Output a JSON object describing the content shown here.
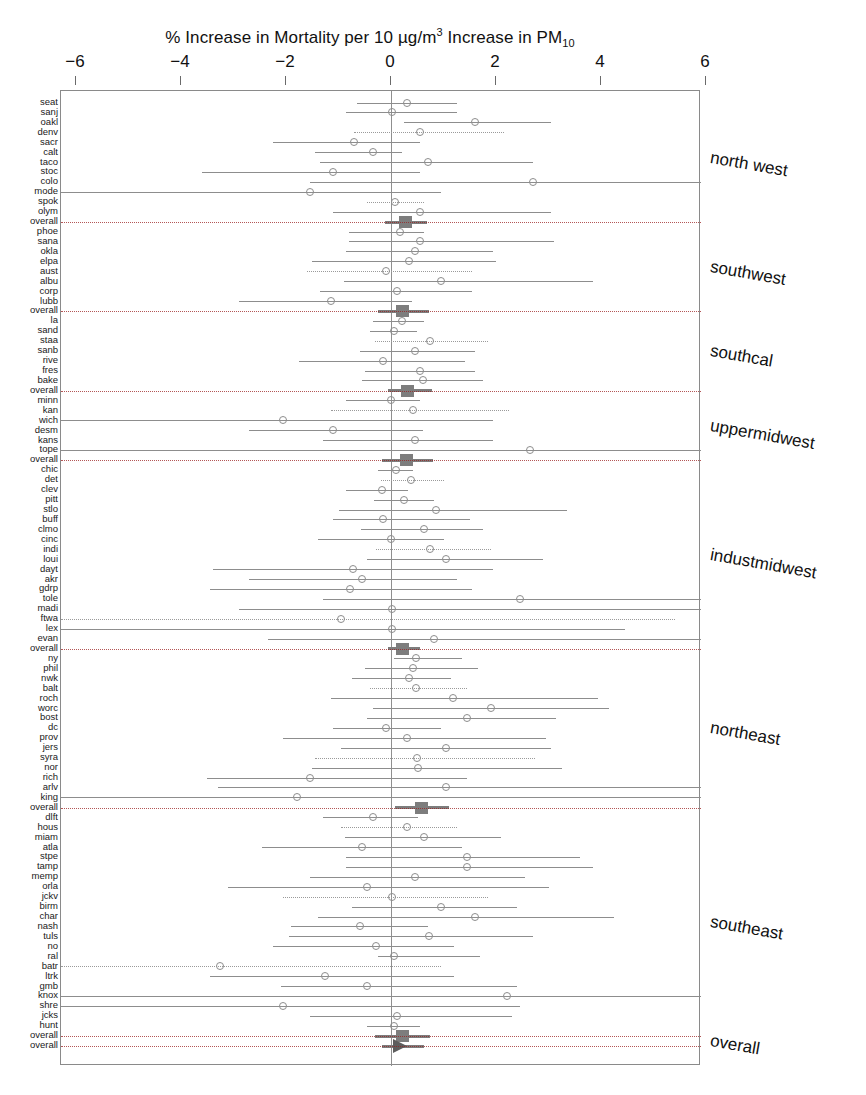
{
  "title": {
    "prefix": "% Increase in Mortality per 10 ",
    "unit": "µg/m",
    "unit_exp": "3",
    "middle": " Increase in PM",
    "sub": "10"
  },
  "axis": {
    "label": "% Increase in Mortality per 10 µg/m3 Increase in PM10",
    "ticks": [
      -6,
      -4,
      -2,
      0,
      2,
      4,
      6
    ],
    "tick_labels": [
      "−6",
      "−4",
      "−2",
      "0",
      "2",
      "4",
      "6"
    ],
    "xmin": -6.8,
    "xmax": 6.7
  },
  "regions": [
    {
      "name": "north west",
      "label": "north west"
    },
    {
      "name": "southwest",
      "label": "southwest"
    },
    {
      "name": "southcal",
      "label": "southcal"
    },
    {
      "name": "uppermidwest",
      "label": "uppermidwest"
    },
    {
      "name": "industmidwest",
      "label": "industmidwest"
    },
    {
      "name": "northeast",
      "label": "northeast"
    },
    {
      "name": "southeast",
      "label": "southeast"
    },
    {
      "name": "overall",
      "label": "overall"
    }
  ],
  "chart_data": {
    "type": "forest",
    "title": "% Increase in Mortality per 10 µg/m3 Increase in PM10",
    "xlabel": "% Increase in Mortality per 10 µg/m3 Increase in PM10",
    "ylabel": "",
    "xlim": [
      -6.8,
      6.7
    ],
    "grid": false,
    "legend": "none",
    "marker_open_circle": "city estimate",
    "marker_filled_square": "regional pooled estimate",
    "marker_triangle": "national pooled estimate",
    "rows": [
      {
        "label": "seat",
        "region": "north west",
        "est": 0.3,
        "lo": -0.65,
        "hi": 1.25,
        "type": "city"
      },
      {
        "label": "sanj",
        "region": "north west",
        "est": 0.02,
        "lo": -0.85,
        "hi": 1.25,
        "type": "city"
      },
      {
        "label": "oakl",
        "region": "north west",
        "est": 1.6,
        "lo": 0.25,
        "hi": 3.05,
        "type": "city"
      },
      {
        "label": "denv",
        "region": "north west",
        "est": 0.55,
        "lo": -0.7,
        "hi": 2.15,
        "type": "city"
      },
      {
        "label": "sacr",
        "region": "north west",
        "est": -0.7,
        "lo": -2.25,
        "hi": 0.55,
        "type": "city"
      },
      {
        "label": "calt",
        "region": "north west",
        "est": -0.35,
        "lo": -1.45,
        "hi": 0.2,
        "type": "city"
      },
      {
        "label": "taco",
        "region": "north west",
        "est": 0.7,
        "lo": -1.35,
        "hi": 2.7,
        "type": "city"
      },
      {
        "label": "stoc",
        "region": "north west",
        "est": -1.1,
        "lo": -3.6,
        "hi": 0.55,
        "type": "city"
      },
      {
        "label": "colo",
        "region": "north west",
        "est": 2.7,
        "lo": -1.55,
        "hi": 6.7,
        "type": "city"
      },
      {
        "label": "mode",
        "region": "north west",
        "est": -1.55,
        "lo": -6.8,
        "hi": 0.95,
        "type": "city"
      },
      {
        "label": "spok",
        "region": "north west",
        "est": 0.08,
        "lo": -0.45,
        "hi": 0.62,
        "type": "city"
      },
      {
        "label": "olym",
        "region": "north west",
        "est": 0.55,
        "lo": -1.1,
        "hi": 3.05,
        "type": "city"
      },
      {
        "label": "overall",
        "region": "north west",
        "est": 0.28,
        "lo": -0.12,
        "hi": 0.68,
        "type": "pooled"
      },
      {
        "label": "phoe",
        "region": "southwest",
        "est": 0.18,
        "lo": -0.8,
        "hi": 0.62,
        "type": "city"
      },
      {
        "label": "sana",
        "region": "southwest",
        "est": 0.55,
        "lo": -0.8,
        "hi": 3.1,
        "type": "city"
      },
      {
        "label": "okla",
        "region": "southwest",
        "est": 0.45,
        "lo": -0.85,
        "hi": 1.95,
        "type": "city"
      },
      {
        "label": "elpa",
        "region": "southwest",
        "est": 0.35,
        "lo": -1.5,
        "hi": 2.0,
        "type": "city"
      },
      {
        "label": "aust",
        "region": "southwest",
        "est": -0.1,
        "lo": -1.6,
        "hi": 1.55,
        "type": "city"
      },
      {
        "label": "albu",
        "region": "southwest",
        "est": 0.95,
        "lo": -0.9,
        "hi": 3.85,
        "type": "city"
      },
      {
        "label": "corp",
        "region": "southwest",
        "est": 0.12,
        "lo": -1.35,
        "hi": 1.55,
        "type": "city"
      },
      {
        "label": "lubb",
        "region": "southwest",
        "est": -1.15,
        "lo": -2.9,
        "hi": 0.4,
        "type": "city"
      },
      {
        "label": "overall",
        "region": "southwest",
        "est": 0.22,
        "lo": -0.25,
        "hi": 0.72,
        "type": "pooled"
      },
      {
        "label": "la",
        "region": "southcal",
        "est": 0.2,
        "lo": -0.35,
        "hi": 0.62,
        "type": "city"
      },
      {
        "label": "sand",
        "region": "southcal",
        "est": 0.05,
        "lo": -0.4,
        "hi": 0.5,
        "type": "city"
      },
      {
        "label": "staa",
        "region": "southcal",
        "est": 0.75,
        "lo": -0.3,
        "hi": 1.85,
        "type": "city"
      },
      {
        "label": "sanb",
        "region": "southcal",
        "est": 0.45,
        "lo": -0.6,
        "hi": 1.6,
        "type": "city"
      },
      {
        "label": "rive",
        "region": "southcal",
        "est": -0.15,
        "lo": -1.75,
        "hi": 1.4,
        "type": "city"
      },
      {
        "label": "fres",
        "region": "southcal",
        "est": 0.55,
        "lo": -0.5,
        "hi": 1.6,
        "type": "city"
      },
      {
        "label": "bake",
        "region": "southcal",
        "est": 0.6,
        "lo": -0.55,
        "hi": 1.75,
        "type": "city"
      },
      {
        "label": "overall",
        "region": "southcal",
        "est": 0.32,
        "lo": -0.05,
        "hi": 0.78,
        "type": "pooled"
      },
      {
        "label": "minn",
        "region": "uppermidwest",
        "est": 0.0,
        "lo": -0.85,
        "hi": 0.55,
        "type": "city"
      },
      {
        "label": "kan",
        "region": "uppermidwest",
        "est": 0.42,
        "lo": -1.15,
        "hi": 2.25,
        "type": "city"
      },
      {
        "label": "wich",
        "region": "uppermidwest",
        "est": -2.05,
        "lo": -6.8,
        "hi": 1.95,
        "type": "city"
      },
      {
        "label": "desm",
        "region": "uppermidwest",
        "est": -1.1,
        "lo": -2.7,
        "hi": 0.6,
        "type": "city"
      },
      {
        "label": "kans",
        "region": "uppermidwest",
        "est": 0.45,
        "lo": -1.3,
        "hi": 1.95,
        "type": "city"
      },
      {
        "label": "tope",
        "region": "uppermidwest",
        "est": 2.65,
        "lo": -6.8,
        "hi": 6.7,
        "type": "city"
      },
      {
        "label": "overall",
        "region": "uppermidwest",
        "est": 0.3,
        "lo": -0.18,
        "hi": 0.8,
        "type": "pooled"
      },
      {
        "label": "chic",
        "region": "industmidwest",
        "est": 0.1,
        "lo": -0.25,
        "hi": 0.42,
        "type": "city"
      },
      {
        "label": "det",
        "region": "industmidwest",
        "est": 0.38,
        "lo": -0.2,
        "hi": 1.0,
        "type": "city"
      },
      {
        "label": "clev",
        "region": "industmidwest",
        "est": -0.18,
        "lo": -0.85,
        "hi": 0.32,
        "type": "city"
      },
      {
        "label": "pitt",
        "region": "industmidwest",
        "est": 0.25,
        "lo": -0.32,
        "hi": 0.82,
        "type": "city"
      },
      {
        "label": "stlo",
        "region": "industmidwest",
        "est": 0.85,
        "lo": -1.0,
        "hi": 3.35,
        "type": "city"
      },
      {
        "label": "buff",
        "region": "industmidwest",
        "est": -0.15,
        "lo": -1.1,
        "hi": 1.5,
        "type": "city"
      },
      {
        "label": "clmo",
        "region": "industmidwest",
        "est": 0.62,
        "lo": -0.58,
        "hi": 1.75,
        "type": "city"
      },
      {
        "label": "cinc",
        "region": "industmidwest",
        "est": 0.0,
        "lo": -1.4,
        "hi": 1.0,
        "type": "city"
      },
      {
        "label": "indi",
        "region": "industmidwest",
        "est": 0.75,
        "lo": -0.28,
        "hi": 1.9,
        "type": "city"
      },
      {
        "label": "loui",
        "region": "industmidwest",
        "est": 1.05,
        "lo": -0.45,
        "hi": 2.9,
        "type": "city"
      },
      {
        "label": "dayt",
        "region": "industmidwest",
        "est": -0.72,
        "lo": -3.4,
        "hi": 1.95,
        "type": "city"
      },
      {
        "label": "akr",
        "region": "industmidwest",
        "est": -0.55,
        "lo": -2.7,
        "hi": 1.25,
        "type": "city"
      },
      {
        "label": "gdrp",
        "region": "industmidwest",
        "est": -0.78,
        "lo": -3.45,
        "hi": 1.55,
        "type": "city"
      },
      {
        "label": "tole",
        "region": "industmidwest",
        "est": 2.45,
        "lo": -1.3,
        "hi": 6.7,
        "type": "city"
      },
      {
        "label": "madi",
        "region": "industmidwest",
        "est": 0.02,
        "lo": -2.9,
        "hi": 6.7,
        "type": "city"
      },
      {
        "label": "ftwa",
        "region": "industmidwest",
        "est": -0.95,
        "lo": -6.8,
        "hi": 5.4,
        "type": "city"
      },
      {
        "label": "lex",
        "region": "industmidwest",
        "est": 0.02,
        "lo": -6.8,
        "hi": 4.45,
        "type": "city"
      },
      {
        "label": "evan",
        "region": "industmidwest",
        "est": 0.82,
        "lo": -2.35,
        "hi": 6.7,
        "type": "city"
      },
      {
        "label": "overall",
        "region": "industmidwest",
        "est": 0.22,
        "lo": -0.05,
        "hi": 0.55,
        "type": "pooled"
      },
      {
        "label": "ny",
        "region": "northeast",
        "est": 0.48,
        "lo": 0.05,
        "hi": 1.35,
        "type": "city"
      },
      {
        "label": "phil",
        "region": "northeast",
        "est": 0.42,
        "lo": -0.5,
        "hi": 1.65,
        "type": "city"
      },
      {
        "label": "nwk",
        "region": "northeast",
        "est": 0.35,
        "lo": -0.75,
        "hi": 1.15,
        "type": "city"
      },
      {
        "label": "balt",
        "region": "northeast",
        "est": 0.48,
        "lo": -0.4,
        "hi": 1.45,
        "type": "city"
      },
      {
        "label": "roch",
        "region": "northeast",
        "est": 1.18,
        "lo": -1.15,
        "hi": 3.95,
        "type": "city"
      },
      {
        "label": "worc",
        "region": "northeast",
        "est": 1.9,
        "lo": -0.35,
        "hi": 4.15,
        "type": "city"
      },
      {
        "label": "bost",
        "region": "northeast",
        "est": 1.45,
        "lo": -0.45,
        "hi": 3.15,
        "type": "city"
      },
      {
        "label": "dc",
        "region": "northeast",
        "est": -0.1,
        "lo": -1.1,
        "hi": 0.95,
        "type": "city"
      },
      {
        "label": "prov",
        "region": "northeast",
        "est": 0.3,
        "lo": -2.05,
        "hi": 2.95,
        "type": "city"
      },
      {
        "label": "jers",
        "region": "northeast",
        "est": 1.05,
        "lo": -0.95,
        "hi": 3.05,
        "type": "city"
      },
      {
        "label": "syra",
        "region": "northeast",
        "est": 0.5,
        "lo": -1.45,
        "hi": 2.75,
        "type": "city"
      },
      {
        "label": "nor",
        "region": "northeast",
        "est": 0.52,
        "lo": -1.5,
        "hi": 3.25,
        "type": "city"
      },
      {
        "label": "rich",
        "region": "northeast",
        "est": -1.55,
        "lo": -3.5,
        "hi": 1.45,
        "type": "city"
      },
      {
        "label": "arlv",
        "region": "northeast",
        "est": 1.05,
        "lo": -3.3,
        "hi": 6.7,
        "type": "city"
      },
      {
        "label": "king",
        "region": "northeast",
        "est": -1.8,
        "lo": -6.8,
        "hi": 6.7,
        "type": "city"
      },
      {
        "label": "overall",
        "region": "northeast",
        "est": 0.58,
        "lo": 0.08,
        "hi": 1.1,
        "type": "pooled"
      },
      {
        "label": "dlft",
        "region": "southeast",
        "est": -0.35,
        "lo": -1.3,
        "hi": 0.52,
        "type": "city"
      },
      {
        "label": "hous",
        "region": "southeast",
        "est": 0.3,
        "lo": -0.95,
        "hi": 1.25,
        "type": "city"
      },
      {
        "label": "miam",
        "region": "southeast",
        "est": 0.62,
        "lo": -0.88,
        "hi": 2.1,
        "type": "city"
      },
      {
        "label": "atla",
        "region": "southeast",
        "est": -0.55,
        "lo": -2.45,
        "hi": 1.35,
        "type": "city"
      },
      {
        "label": "stpe",
        "region": "southeast",
        "est": 1.45,
        "lo": -0.85,
        "hi": 3.6,
        "type": "city"
      },
      {
        "label": "tamp",
        "region": "southeast",
        "est": 1.45,
        "lo": -0.85,
        "hi": 3.85,
        "type": "city"
      },
      {
        "label": "memp",
        "region": "southeast",
        "est": 0.45,
        "lo": -1.55,
        "hi": 2.55,
        "type": "city"
      },
      {
        "label": "orla",
        "region": "southeast",
        "est": -0.45,
        "lo": -3.1,
        "hi": 3.0,
        "type": "city"
      },
      {
        "label": "jckv",
        "region": "southeast",
        "est": 0.02,
        "lo": -2.05,
        "hi": 1.85,
        "type": "city"
      },
      {
        "label": "birm",
        "region": "southeast",
        "est": 0.95,
        "lo": -0.75,
        "hi": 2.4,
        "type": "city"
      },
      {
        "label": "char",
        "region": "southeast",
        "est": 1.6,
        "lo": -1.4,
        "hi": 4.25,
        "type": "city"
      },
      {
        "label": "nash",
        "region": "southeast",
        "est": -0.6,
        "lo": -1.9,
        "hi": 0.7,
        "type": "city"
      },
      {
        "label": "tuls",
        "region": "southeast",
        "est": 0.72,
        "lo": -1.95,
        "hi": 2.7,
        "type": "city"
      },
      {
        "label": "no",
        "region": "southeast",
        "est": -0.28,
        "lo": -2.25,
        "hi": 1.2,
        "type": "city"
      },
      {
        "label": "ral",
        "region": "southeast",
        "est": 0.05,
        "lo": -0.25,
        "hi": 1.7,
        "type": "city"
      },
      {
        "label": "batr",
        "region": "southeast",
        "est": -3.25,
        "lo": -6.8,
        "hi": 0.95,
        "type": "city"
      },
      {
        "label": "ltrk",
        "region": "southeast",
        "est": -1.25,
        "lo": -3.45,
        "hi": 1.2,
        "type": "city"
      },
      {
        "label": "gmb",
        "region": "southeast",
        "est": -0.45,
        "lo": -2.1,
        "hi": 2.4,
        "type": "city"
      },
      {
        "label": "knox",
        "region": "southeast",
        "est": 2.2,
        "lo": -6.8,
        "hi": 6.7,
        "type": "city"
      },
      {
        "label": "shre",
        "region": "southeast",
        "est": -2.05,
        "lo": -6.8,
        "hi": 2.45,
        "type": "city"
      },
      {
        "label": "jcks",
        "region": "southeast",
        "est": 0.12,
        "lo": -1.55,
        "hi": 2.3,
        "type": "city"
      },
      {
        "label": "hunt",
        "region": "southeast",
        "est": 0.05,
        "lo": -0.45,
        "hi": 0.55,
        "type": "city"
      },
      {
        "label": "overall",
        "region": "southeast",
        "est": 0.22,
        "lo": -0.3,
        "hi": 0.75,
        "type": "pooled"
      },
      {
        "label": "overall",
        "region": "overall",
        "est": 0.18,
        "lo": -0.18,
        "hi": 0.62,
        "type": "national"
      }
    ]
  }
}
